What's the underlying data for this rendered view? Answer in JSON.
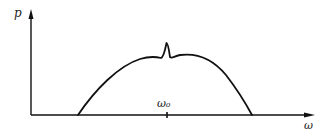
{
  "diagram": {
    "type": "spectrum-plot",
    "y_axis_label": "p",
    "x_axis_label": "ω",
    "center_tick_label": "ω₀",
    "curve_description": "Broad dome-shaped distribution with a narrow sharp peak at ω₀",
    "colors": {
      "line": "#111111",
      "background": "#ffffff"
    }
  }
}
